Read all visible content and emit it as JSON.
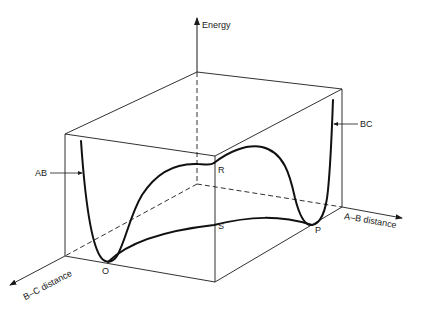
{
  "diagram": {
    "type": "potential energy surface (3D box)",
    "axes": {
      "energy": "Energy",
      "ab_distance": "A–B distance",
      "bc_distance": "B–C distance"
    },
    "curve_labels": {
      "ab": "AB",
      "bc": "BC"
    },
    "points": {
      "O": "O",
      "P": "P",
      "R": "R",
      "S": "S"
    },
    "colors": {
      "line": "#1a1a1a",
      "background": "#ffffff"
    }
  }
}
